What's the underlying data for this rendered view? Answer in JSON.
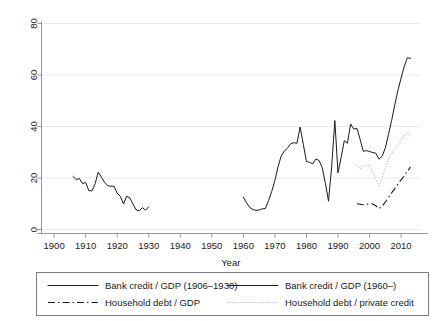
{
  "chart_data": {
    "type": "line",
    "title": "",
    "subtitle": "",
    "xlabel": "Year",
    "ylabel": "",
    "xlim": [
      1896,
      2016
    ],
    "ylim": [
      0,
      80
    ],
    "xticks": [
      1900,
      1910,
      1920,
      1930,
      1940,
      1950,
      1960,
      1970,
      1980,
      1990,
      2000,
      2010
    ],
    "yticks": [
      0,
      20,
      40,
      60,
      80
    ],
    "xtick_labels": [
      "1900",
      "1910",
      "1920",
      "1930",
      "1940",
      "1950",
      "1960",
      "1970",
      "1980",
      "1990",
      "2000",
      "2010"
    ],
    "ytick_labels": [
      "0",
      "20",
      "40",
      "60",
      "80"
    ],
    "grid": "horizontal",
    "legend_position": "below-plot",
    "series": [
      {
        "name": "Bank credit / GDP (1906–1930)",
        "style": "solid",
        "color": "#1a1a1a",
        "x": [
          1906,
          1907,
          1908,
          1909,
          1910,
          1911,
          1912,
          1913,
          1914,
          1915,
          1916,
          1917,
          1918,
          1919,
          1920,
          1921,
          1922,
          1923,
          1924,
          1925,
          1926,
          1927,
          1928,
          1929,
          1930
        ],
        "values": [
          20.6,
          19.4,
          19.8,
          17.8,
          18.3,
          15.1,
          15.0,
          17.8,
          22.3,
          20.3,
          18.3,
          17.0,
          16.8,
          16.8,
          14.1,
          12.9,
          9.9,
          12.9,
          12.3,
          9.9,
          7.6,
          7.3,
          8.5,
          7.5,
          8.8
        ]
      },
      {
        "name": "Bank credit / GDP (1960–)",
        "style": "solid",
        "color": "#1a1a1a",
        "x": [
          1960,
          1961,
          1962,
          1963,
          1964,
          1965,
          1966,
          1967,
          1968,
          1969,
          1970,
          1971,
          1972,
          1973,
          1974,
          1975,
          1976,
          1977,
          1978,
          1979,
          1980,
          1981,
          1982,
          1983,
          1984,
          1985,
          1986,
          1987,
          1988,
          1989,
          1990,
          1991,
          1992,
          1993,
          1994,
          1995,
          1996,
          1997,
          1998,
          1999,
          2000,
          2001,
          2002,
          2003,
          2004,
          2005,
          2006,
          2007,
          2008,
          2009,
          2010,
          2011,
          2012,
          2013
        ],
        "values": [
          12.6,
          10.4,
          8.6,
          7.8,
          7.4,
          7.6,
          8.0,
          8.2,
          11.3,
          14.8,
          19.1,
          24.4,
          28.6,
          30.5,
          31.6,
          33.3,
          33.7,
          33.5,
          39.8,
          33.1,
          26.4,
          26.1,
          25.5,
          27.4,
          26.8,
          24.0,
          18.0,
          11.0,
          24.5,
          42.3,
          22.0,
          28.0,
          34.5,
          33.5,
          41.0,
          39.0,
          39.3,
          35.1,
          30.4,
          30.6,
          30.3,
          29.9,
          29.6,
          27.3,
          28.5,
          31.6,
          36.9,
          42.3,
          48.4,
          54.0,
          58.8,
          63.3,
          66.7,
          66.5
        ]
      },
      {
        "name": "Household debt / GDP",
        "style": "dash-dot",
        "color": "#1a1a1a",
        "x": [
          1996,
          1997,
          1998,
          1999,
          2000,
          2001,
          2002,
          2003,
          2004,
          2005,
          2006,
          2007,
          2008,
          2009,
          2010,
          2011,
          2012,
          2013
        ],
        "values": [
          10.0,
          9.8,
          9.6,
          9.7,
          10.1,
          9.9,
          9.2,
          8.1,
          9.1,
          10.6,
          12.5,
          14.2,
          15.9,
          17.6,
          19.3,
          20.8,
          22.6,
          24.3
        ]
      },
      {
        "name": "Household debt / private credit",
        "style": "dotted",
        "color": "#b4b4b4",
        "x": [
          1996,
          1997,
          1998,
          1999,
          2000,
          2001,
          2002,
          2003,
          2004,
          2005,
          2006,
          2007,
          2008,
          2009,
          2010,
          2011,
          2012,
          2013
        ],
        "values": [
          24.9,
          23.5,
          25.2,
          24.7,
          25.1,
          22.0,
          19.6,
          17.0,
          20.0,
          24.0,
          27.5,
          29.6,
          31.3,
          33.0,
          34.6,
          36.6,
          37.5,
          36.2
        ]
      }
    ]
  },
  "axes": {
    "xlabel": "Year"
  },
  "legend": {
    "entries": [
      {
        "label": "Bank credit / GDP (1906–1930)",
        "style": "solid",
        "color": "#1a1a1a"
      },
      {
        "label": "Bank credit / GDP (1960–)",
        "style": "solid",
        "color": "#1a1a1a"
      },
      {
        "label": "Household debt / GDP",
        "style": "dash-dot",
        "color": "#1a1a1a"
      },
      {
        "label": "Household debt / private credit",
        "style": "dotted",
        "color": "#b4b4b4"
      }
    ]
  },
  "colors": {
    "background": "#ffffff",
    "foreground": "#1a1a1a",
    "grid": "#e8e8e8",
    "axis": "#8a8a8a",
    "light_series": "#b4b4b4"
  }
}
